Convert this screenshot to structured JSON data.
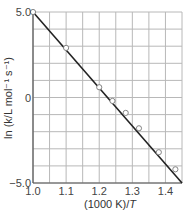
{
  "chart_data": {
    "type": "scatter",
    "title": "",
    "xlabel": "(1000 K)/T",
    "ylabel": "ln (k/L mol⁻¹ s⁻¹)",
    "xlim": [
      1.0,
      1.45
    ],
    "ylim": [
      -5.0,
      5.0
    ],
    "grid": true,
    "x_ticks": [
      "1.0",
      "1.1",
      "1.2",
      "1.3",
      "1.4"
    ],
    "y_ticks": [
      "5.0",
      "0",
      "-5.0"
    ],
    "series": [
      {
        "name": "data points",
        "marker": "open-circle",
        "x": [
          1.0,
          1.1,
          1.2,
          1.24,
          1.28,
          1.32,
          1.38,
          1.43
        ],
        "y": [
          5.0,
          2.9,
          0.6,
          -0.2,
          -0.9,
          -1.8,
          -3.2,
          -4.2
        ]
      },
      {
        "name": "linear fit",
        "marker": "line",
        "x": [
          1.0,
          1.45
        ],
        "y": [
          5.0,
          -5.0
        ]
      }
    ],
    "legend": "none"
  },
  "labels": {
    "xlabel_prefix": "(1000 K)/",
    "xlabel_var": "T",
    "ylabel": "ln (k/L mol⁻¹ s⁻¹)"
  },
  "colors": {
    "grid": "#b8b8b8",
    "axis": "#555555",
    "line": "#222222",
    "marker_fill": "#ffffff",
    "marker_stroke": "#777777"
  }
}
